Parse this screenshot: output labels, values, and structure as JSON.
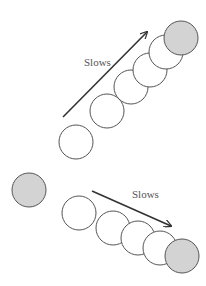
{
  "diagram": {
    "upper": {
      "label": "Slows",
      "label_pos": [
        84,
        66
      ],
      "arrow": {
        "from": [
          63,
          117
        ],
        "to": [
          147,
          32
        ]
      },
      "circles": [
        {
          "cx": 76,
          "cy": 142,
          "r": 17,
          "fill": "#ffffff"
        },
        {
          "cx": 107,
          "cy": 111,
          "r": 17,
          "fill": "#ffffff"
        },
        {
          "cx": 131,
          "cy": 87,
          "r": 17,
          "fill": "#ffffff"
        },
        {
          "cx": 150,
          "cy": 70,
          "r": 17,
          "fill": "#ffffff"
        },
        {
          "cx": 166,
          "cy": 52,
          "r": 17,
          "fill": "#ffffff"
        },
        {
          "cx": 181,
          "cy": 38,
          "r": 17,
          "fill": "#d3d3d3"
        }
      ]
    },
    "lower": {
      "label": "Slows",
      "label_pos": [
        132,
        198
      ],
      "arrow": {
        "from": [
          92,
          191
        ],
        "to": [
          171,
          226
        ]
      },
      "start_circle": {
        "cx": 29,
        "cy": 190,
        "r": 17,
        "fill": "#d3d3d3"
      },
      "circles": [
        {
          "cx": 79,
          "cy": 213,
          "r": 17,
          "fill": "#ffffff"
        },
        {
          "cx": 113,
          "cy": 228,
          "r": 17,
          "fill": "#ffffff"
        },
        {
          "cx": 138,
          "cy": 238,
          "r": 17,
          "fill": "#ffffff"
        },
        {
          "cx": 160,
          "cy": 248,
          "r": 17,
          "fill": "#ffffff"
        },
        {
          "cx": 182,
          "cy": 256,
          "r": 17,
          "fill": "#d3d3d3"
        }
      ]
    },
    "colors": {
      "stroke": "#555555",
      "arrow": "#333333",
      "filled": "#d3d3d3"
    }
  }
}
